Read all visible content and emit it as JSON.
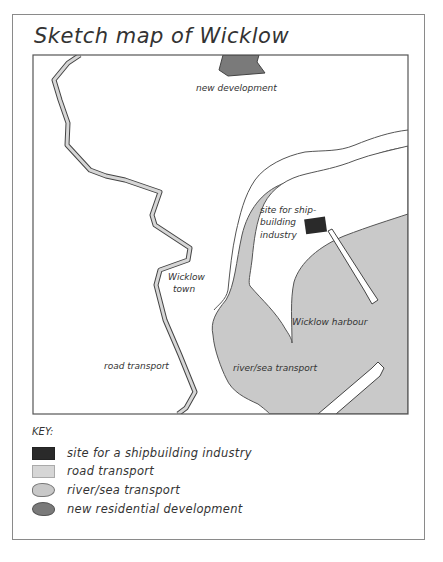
{
  "title": "Sketch map of Wicklow",
  "map": {
    "labels": {
      "new_development": "new development",
      "site_line1": "site for ship-",
      "site_line2": "building",
      "site_line3": "industry",
      "town_line1": "Wicklow",
      "town_line2": "town",
      "harbour": "Wicklow harbour",
      "road_transport": "road transport",
      "river_sea_transport": "river/sea transport"
    },
    "colors": {
      "shipbuilding_site": "#2a2a2a",
      "road": "#d6d6d6",
      "river_sea": "#c8c8c8",
      "new_development": "#7a7a7a",
      "outline": "#555555"
    }
  },
  "key": {
    "title": "KEY:",
    "items": [
      {
        "icon": "black-rectangle",
        "label": "site for a shipbuilding industry"
      },
      {
        "icon": "light-grey-rectangle",
        "label": "road transport"
      },
      {
        "icon": "grey-blob",
        "label": "river/sea transport"
      },
      {
        "icon": "dark-grey-blob",
        "label": "new residential development"
      }
    ]
  }
}
